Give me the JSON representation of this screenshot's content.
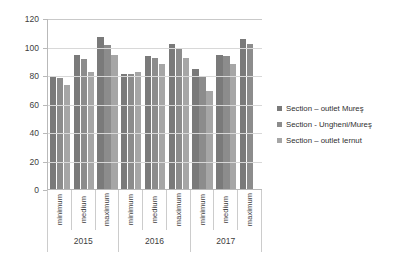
{
  "chart_data": {
    "type": "bar",
    "title": "",
    "subtitle": "",
    "xlabel": "",
    "ylabel": "",
    "ylim": [
      0,
      120
    ],
    "yticks": [
      0,
      20,
      40,
      60,
      80,
      100,
      120
    ],
    "grid": true,
    "legend_position": "right",
    "categories": [
      "minimum",
      "medium",
      "maximum",
      "minimum",
      "medium",
      "maximum",
      "minimum",
      "medium",
      "maximum"
    ],
    "group_labels": [
      "2015",
      "2016",
      "2017"
    ],
    "group_spans": [
      3,
      3,
      3
    ],
    "series": [
      {
        "name": "Section – outlet Mureş",
        "color": "#7a7a7a",
        "values": [
          79,
          94,
          107,
          81,
          93,
          102,
          84,
          94,
          105
        ]
      },
      {
        "name": "Section - Ungheni/Mureş",
        "color": "#8c8c8c",
        "values": [
          78,
          91,
          101,
          81,
          92,
          99,
          79,
          93,
          102
        ]
      },
      {
        "name": "Section – outlet Iernut",
        "color": "#a6a6a6",
        "values": [
          73,
          82,
          94,
          82,
          88,
          92,
          69,
          88,
          null
        ]
      }
    ]
  },
  "legend": {
    "items": [
      {
        "label": "Section – outlet Mureş",
        "color": "#7a7a7a"
      },
      {
        "label": "Section - Ungheni/Mureş",
        "color": "#8c8c8c"
      },
      {
        "label": "Section – outlet Iernut",
        "color": "#a6a6a6"
      }
    ]
  }
}
